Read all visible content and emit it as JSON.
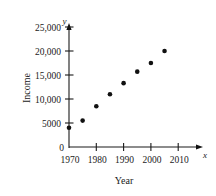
{
  "chart_data": {
    "type": "scatter",
    "title": "",
    "xlabel": "Year",
    "ylabel": "Income",
    "x_axis_variable": "x",
    "y_axis_variable": "y",
    "x": [
      1970,
      1975,
      1980,
      1985,
      1990,
      1995,
      2000,
      2005
    ],
    "values": [
      4000,
      5500,
      8500,
      11000,
      13300,
      15700,
      17500,
      20000
    ],
    "series": [
      {
        "name": "Income",
        "values": [
          4000,
          5500,
          8500,
          11000,
          13300,
          15700,
          17500,
          20000
        ]
      }
    ],
    "xlim": [
      1970,
      2012
    ],
    "ylim": [
      0,
      26500
    ],
    "xticks": [
      1970,
      1980,
      1990,
      2000,
      2010
    ],
    "xtick_labels": [
      "1970",
      "1980",
      "1990",
      "2000",
      "2010"
    ],
    "yticks": [
      0,
      5000,
      10000,
      15000,
      20000,
      25000
    ],
    "ytick_labels": [
      "0",
      "5000",
      "10,000",
      "15,000",
      "20,000",
      "25,000"
    ],
    "grid": false,
    "legend": false,
    "legend_position": "none",
    "marker": "filled-circle",
    "marker_color": "#111111"
  },
  "figure": {
    "x_axis_label": "Year",
    "y_axis_label": "Income",
    "x_variable_symbol": "x",
    "y_variable_symbol": "y",
    "y_tick_labels": {
      "t0": "0",
      "t1": "5000",
      "t2": "10,000",
      "t3": "15,000",
      "t4": "20,000",
      "t5": "25,000"
    },
    "x_tick_labels": {
      "t0": "1970",
      "t1": "1980",
      "t2": "1990",
      "t3": "2000",
      "t4": "2010"
    }
  },
  "colors": {
    "ink": "#1a1a1a",
    "marker": "#111111",
    "background": "#ffffff"
  }
}
